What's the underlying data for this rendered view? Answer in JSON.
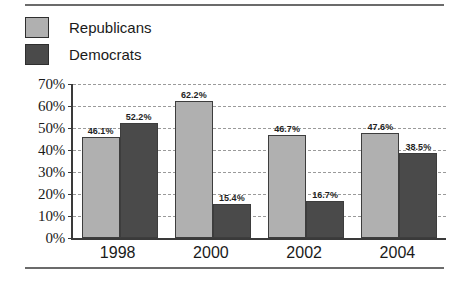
{
  "chart_data": {
    "type": "bar",
    "title": "",
    "xlabel": "",
    "ylabel": "",
    "categories": [
      "1998",
      "2000",
      "2002",
      "2004"
    ],
    "series": [
      {
        "name": "Republicans",
        "color": "#b0b0b0",
        "values": [
          46.1,
          62.2,
          46.7,
          47.6
        ],
        "labels": [
          "46.1%",
          "62.2%",
          "46.7%",
          "47.6%"
        ]
      },
      {
        "name": "Democrats",
        "color": "#4a4a4a",
        "values": [
          52.2,
          15.4,
          16.7,
          38.5
        ],
        "labels": [
          "52.2%",
          "15.4%",
          "16.7%",
          "38.5%"
        ]
      }
    ],
    "ylim": [
      0,
      70
    ],
    "ytick_values": [
      70,
      60,
      50,
      40,
      30,
      20,
      10,
      0
    ],
    "ytick_labels": [
      "70%",
      "60%",
      "50%",
      "40%",
      "30%",
      "20%",
      "10%",
      "0%"
    ],
    "grid": true,
    "legend_position": "top-left"
  },
  "legend": {
    "items": [
      {
        "label": "Republicans",
        "swatch_name": "legend-swatch-republicans"
      },
      {
        "label": "Democrats",
        "swatch_name": "legend-swatch-democrats"
      }
    ]
  }
}
